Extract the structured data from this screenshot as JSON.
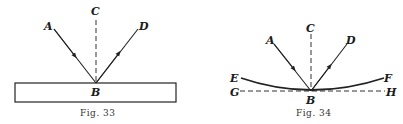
{
  "figures": [
    {
      "caption": "Fig. 33",
      "labels": {
        "A": "A",
        "B": "B",
        "C": "C",
        "D": "D"
      },
      "description": "Reflection of ray AB from plane mirror; BC normal, BD reflected ray"
    },
    {
      "caption": "Fig. 34",
      "labels": {
        "A": "A",
        "B": "B",
        "C": "C",
        "D": "D",
        "E": "E",
        "F": "F",
        "G": "G",
        "H": "H"
      },
      "description": "Reflection from curved mirror EF; GH tangent at B, BC normal"
    }
  ]
}
